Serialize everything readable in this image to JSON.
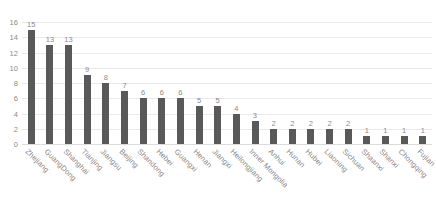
{
  "chart_data": {
    "type": "bar",
    "title": "",
    "subtitle": "",
    "xlabel": "",
    "ylabel": "",
    "ylim": [
      0,
      16
    ],
    "yticks": [
      0,
      2,
      4,
      6,
      8,
      10,
      12,
      14,
      16
    ],
    "grid": true,
    "legend": false,
    "data_labels": true,
    "bar_color": "#595959",
    "gridline_color": "#e9e9e9",
    "text_color": "#8a8a8a",
    "categories": [
      "Zhejiang",
      "GuangDong",
      "Shanghai",
      "Tianjing",
      "Jiangsu",
      "Beijing",
      "Shandong",
      "Hebei",
      "Guangxi",
      "Henan",
      "Jiangxi",
      "Heilongjiang",
      "Inner Mongolia",
      "Anhui",
      "Hunan",
      "Hubei",
      "Liaoning",
      "Sichuan",
      "Shaanxi",
      "Shanxi",
      "Chongqing",
      "Fujian"
    ],
    "values": [
      15,
      13,
      13,
      9,
      8,
      7,
      6,
      6,
      6,
      5,
      5,
      4,
      3,
      2,
      2,
      2,
      2,
      2,
      1,
      1,
      1,
      1
    ]
  }
}
